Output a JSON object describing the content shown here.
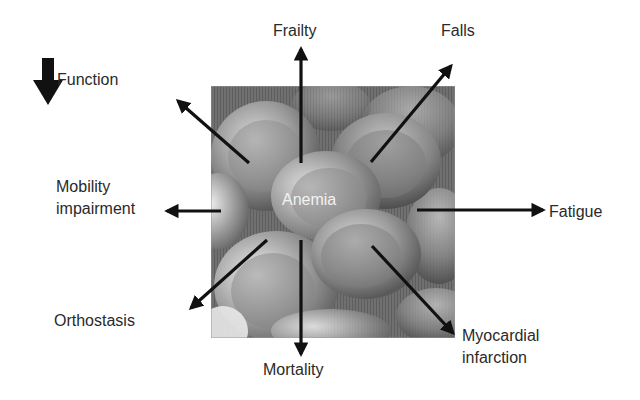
{
  "diagram": {
    "center": {
      "label": "Anemia",
      "image": "red-blood-cells-micrograph"
    },
    "decline_indicator": {
      "icon": "arrow-down-icon",
      "label": "Function"
    },
    "outcomes": [
      {
        "id": "frailty",
        "label": "Frailty",
        "direction": "up"
      },
      {
        "id": "falls",
        "label": "Falls",
        "direction": "up-right"
      },
      {
        "id": "fatigue",
        "label": "Fatigue",
        "direction": "right"
      },
      {
        "id": "myocardial-infarction",
        "label_line1": "Myocardial",
        "label_line2": "infarction",
        "direction": "down-right"
      },
      {
        "id": "mortality",
        "label": "Mortality",
        "direction": "down"
      },
      {
        "id": "orthostasis",
        "label": "Orthostasis",
        "direction": "down-left"
      },
      {
        "id": "mobility-impairment",
        "label_line1": "Mobility",
        "label_line2": "impairment",
        "direction": "left"
      },
      {
        "id": "function-decline",
        "label": "",
        "direction": "up-left"
      }
    ],
    "colors": {
      "arrow": "#111111",
      "text": "#2a2a2a",
      "center_text": "#f2f2f2",
      "image_base": "#6f6f6f"
    }
  }
}
